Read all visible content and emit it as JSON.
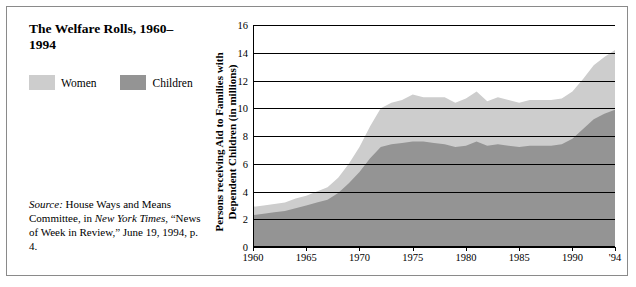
{
  "chart_title": "The Welfare Rolls, 1960–1994",
  "legend": {
    "items": [
      {
        "label": "Women",
        "color": "#cdcdcd"
      },
      {
        "label": "Children",
        "color": "#949494"
      }
    ]
  },
  "source": {
    "label": "Source:",
    "text": " House Ways and Means Committee, in ",
    "italic1": "New York Times",
    "text2": ", “News of Week in Review,” June 19, 1994, p. 4."
  },
  "chart_data": {
    "type": "area",
    "title": "The Welfare Rolls, 1960–1994",
    "xlabel": "",
    "ylabel": "Persons receiving Aid to Families with Dependent Children (in millions)",
    "stacked": true,
    "grid": true,
    "legend_position": "top-left-outside",
    "xlim": [
      1960,
      1994
    ],
    "ylim": [
      0,
      16
    ],
    "yticks": [
      0,
      2,
      4,
      6,
      8,
      10,
      12,
      14,
      16
    ],
    "xticks": [
      1960,
      1965,
      1970,
      1975,
      1980,
      1985,
      1990,
      1994
    ],
    "xtick_labels": [
      "1960",
      "1965",
      "1970",
      "1975",
      "1980",
      "1985",
      "1990",
      "'94"
    ],
    "x": [
      1960,
      1961,
      1962,
      1963,
      1964,
      1965,
      1966,
      1967,
      1968,
      1969,
      1970,
      1971,
      1972,
      1973,
      1974,
      1975,
      1976,
      1977,
      1978,
      1979,
      1980,
      1981,
      1982,
      1983,
      1984,
      1985,
      1986,
      1987,
      1988,
      1989,
      1990,
      1991,
      1992,
      1993,
      1994
    ],
    "series": [
      {
        "name": "Children",
        "color": "#949494",
        "values": [
          2.3,
          2.4,
          2.5,
          2.6,
          2.8,
          3.0,
          3.2,
          3.4,
          3.9,
          4.6,
          5.4,
          6.4,
          7.2,
          7.4,
          7.5,
          7.6,
          7.6,
          7.5,
          7.4,
          7.2,
          7.3,
          7.6,
          7.3,
          7.4,
          7.3,
          7.2,
          7.3,
          7.3,
          7.3,
          7.4,
          7.8,
          8.5,
          9.2,
          9.6,
          9.9
        ]
      },
      {
        "name": "Women",
        "color": "#cdcdcd",
        "values": [
          0.6,
          0.6,
          0.6,
          0.6,
          0.7,
          0.7,
          0.8,
          0.9,
          1.1,
          1.4,
          1.8,
          2.3,
          2.8,
          3.0,
          3.1,
          3.4,
          3.2,
          3.3,
          3.4,
          3.2,
          3.4,
          3.6,
          3.2,
          3.4,
          3.3,
          3.2,
          3.3,
          3.3,
          3.3,
          3.3,
          3.4,
          3.6,
          3.9,
          4.1,
          4.3
        ]
      }
    ],
    "totals": [
      2.9,
      3.0,
      3.1,
      3.2,
      3.5,
      3.7,
      4.0,
      4.3,
      5.0,
      6.0,
      7.2,
      8.7,
      10.0,
      10.4,
      10.6,
      11.0,
      10.8,
      10.8,
      10.8,
      10.4,
      10.7,
      11.2,
      10.5,
      10.8,
      10.6,
      10.4,
      10.6,
      10.6,
      10.6,
      10.7,
      11.2,
      12.1,
      13.1,
      13.7,
      14.2
    ]
  }
}
